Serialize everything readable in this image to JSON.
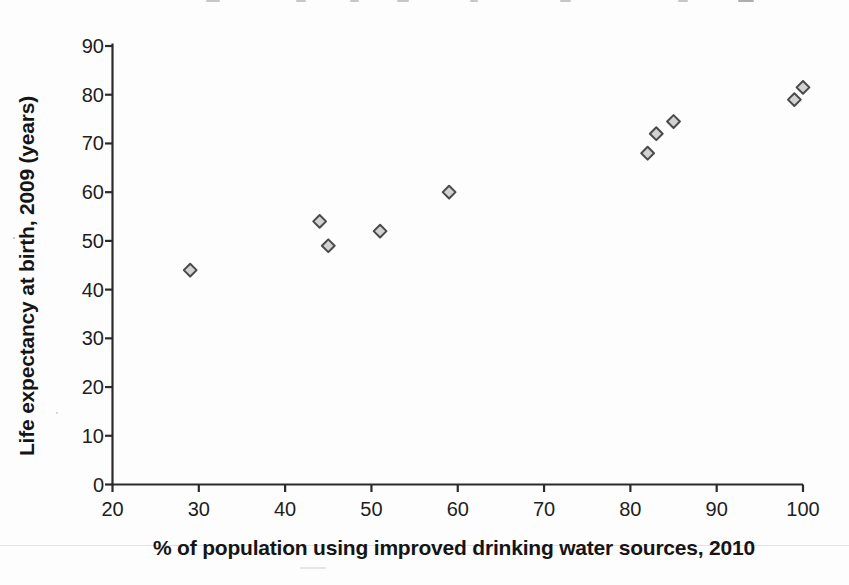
{
  "figure": {
    "background_color": "#fdfdfd"
  },
  "chart_data": {
    "type": "scatter",
    "title": "",
    "xlabel": "% of population using improved drinking water sources, 2010",
    "ylabel": "Life expectancy at birth, 2009 (years)",
    "xlim": [
      20,
      100
    ],
    "ylim": [
      0,
      90
    ],
    "x_ticks": [
      20,
      30,
      40,
      50,
      60,
      70,
      80,
      90,
      100
    ],
    "y_ticks": [
      0,
      10,
      20,
      30,
      40,
      50,
      60,
      70,
      80,
      90
    ],
    "grid": false,
    "marker": {
      "shape": "diamond",
      "fill": "#d2d2d2",
      "stroke": "#4a4a4a"
    },
    "axis_color": "#2b2b2b",
    "text_color": "#1e1e1e",
    "points": [
      {
        "x": 29,
        "y": 44
      },
      {
        "x": 44,
        "y": 54
      },
      {
        "x": 45,
        "y": 49
      },
      {
        "x": 51,
        "y": 52
      },
      {
        "x": 59,
        "y": 60
      },
      {
        "x": 82,
        "y": 68
      },
      {
        "x": 83,
        "y": 72
      },
      {
        "x": 85,
        "y": 74.5
      },
      {
        "x": 99,
        "y": 79
      },
      {
        "x": 100,
        "y": 81.5
      }
    ]
  }
}
